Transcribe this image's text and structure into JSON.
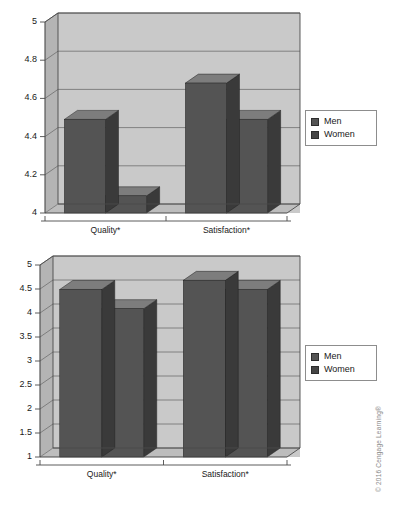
{
  "figure": {
    "copyright": "© 2016 Cengage Learning®",
    "colors": {
      "bar_front": "#545454",
      "bar_top": "#7d7d7d",
      "bar_side": "#3a3a3a",
      "plot_background": "#c9c9c9",
      "wall_side": "#b4b4b4",
      "floor": "#bdbdbd",
      "gridline": "#6e6e6e",
      "axis": "#4a4a4a",
      "text": "#1a1a1a"
    }
  },
  "charts": [
    {
      "id": "chart-top",
      "legend": {
        "position": "right",
        "items": [
          "Men",
          "Women"
        ]
      },
      "chart_data": {
        "type": "bar",
        "title": "",
        "xlabel": "",
        "ylabel": "",
        "categories": [
          "Quality*",
          "Satisfaction*"
        ],
        "series": [
          {
            "name": "Men",
            "values": [
              4.49,
              4.68
            ]
          },
          {
            "name": "Women",
            "values": [
              4.09,
              4.49
            ]
          }
        ],
        "yticks": [
          "4",
          "4.2",
          "4.4",
          "4.6",
          "4.8",
          "5"
        ],
        "ytick_values": [
          4,
          4.2,
          4.4,
          4.6,
          4.8,
          5
        ],
        "ylim": [
          4,
          5
        ],
        "grid": true,
        "three_d": true
      }
    },
    {
      "id": "chart-bottom",
      "legend": {
        "position": "right",
        "items": [
          "Men",
          "Women"
        ]
      },
      "chart_data": {
        "type": "bar",
        "title": "",
        "xlabel": "",
        "ylabel": "",
        "categories": [
          "Quality*",
          "Satisfaction*"
        ],
        "series": [
          {
            "name": "Men",
            "values": [
              4.49,
              4.68
            ]
          },
          {
            "name": "Women",
            "values": [
              4.09,
              4.49
            ]
          }
        ],
        "yticks": [
          "1",
          "1.5",
          "2",
          "2.5",
          "3",
          "3.5",
          "4",
          "4.5",
          "5"
        ],
        "ytick_values": [
          1,
          1.5,
          2,
          2.5,
          3,
          3.5,
          4,
          4.5,
          5
        ],
        "ylim": [
          1,
          5
        ],
        "grid": true,
        "three_d": true
      }
    }
  ]
}
